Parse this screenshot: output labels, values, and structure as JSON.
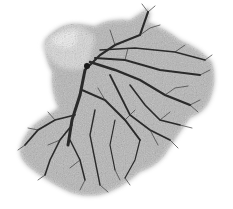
{
  "image": {
    "subject": "vascular-tree-cast",
    "background_color": "#ffffff",
    "mass_color_light": "#bdbdbd",
    "mass_color_mid": "#8a8a8a",
    "vessel_color": "#2a2a2a",
    "highlight_color": "#e6e6e6"
  }
}
